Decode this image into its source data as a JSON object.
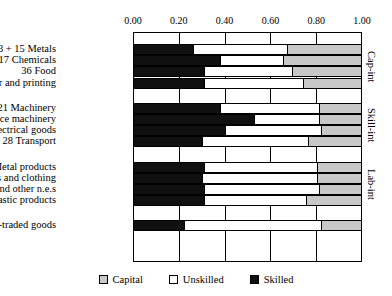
{
  "chart_data": {
    "type": "bar",
    "orientation": "horizontal",
    "stacked": true,
    "title": "",
    "xlabel": "",
    "ylabel": "",
    "xlim": [
      0.0,
      1.0
    ],
    "grid": true,
    "legend_position": "bottom",
    "tick_labels": [
      "0.00",
      "0.20",
      "0.40",
      "0.60",
      "0.80",
      "1.00"
    ],
    "tick_values": [
      0.0,
      0.2,
      0.4,
      0.6,
      0.8,
      1.0
    ],
    "series": [
      {
        "name": "Skilled",
        "color": "#101010",
        "values": [
          0.26,
          0.38,
          0.31,
          0.31,
          0.38,
          0.53,
          0.4,
          0.3,
          0.31,
          0.3,
          0.31,
          0.31,
          0.22
        ]
      },
      {
        "name": "Unskilled",
        "color": "#ffffff",
        "values": [
          0.42,
          0.28,
          0.39,
          0.44,
          0.44,
          0.29,
          0.43,
          0.47,
          0.5,
          0.51,
          0.51,
          0.45,
          0.61
        ]
      },
      {
        "name": "Capital",
        "color": "#c8c8c8",
        "values": [
          0.32,
          0.34,
          0.3,
          0.25,
          0.18,
          0.18,
          0.17,
          0.23,
          0.19,
          0.19,
          0.18,
          0.24,
          0.17
        ]
      }
    ],
    "categories": [
      "13 + 15 Metals",
      "17 Chemicals",
      "36 Food",
      "47 Paper and printing",
      "21 Machinery",
      "23 Office machinery",
      "25 Electrical goods",
      "28 Transport",
      "19 Metal products",
      "42 Textiles and clothing",
      "48 Timber and other n.e.s",
      "49 Plastic products",
      "Non-traded goods"
    ],
    "legend": [
      {
        "label": "Capital",
        "color": "#c8c8c8"
      },
      {
        "label": "Unskilled",
        "color": "#ffffff"
      },
      {
        "label": "Skilled",
        "color": "#101010"
      }
    ],
    "groups": [
      {
        "label": "Cap-int",
        "rows": [
          0,
          1,
          2,
          3
        ]
      },
      {
        "label": "Skill-int",
        "rows": [
          4,
          5,
          6,
          7
        ]
      },
      {
        "label": "Lab-int",
        "rows": [
          8,
          9,
          10,
          11
        ]
      },
      {
        "label": "",
        "rows": [
          12
        ]
      }
    ]
  },
  "axis": {
    "ticks": [
      {
        "label": "0.00",
        "value": 0.0
      },
      {
        "label": "0.20",
        "value": 0.2
      },
      {
        "label": "0.40",
        "value": 0.4
      },
      {
        "label": "0.60",
        "value": 0.6
      },
      {
        "label": "0.80",
        "value": 0.8
      },
      {
        "label": "1.00",
        "value": 1.0
      }
    ]
  },
  "rows": [
    {
      "label": "13 + 15 Metals",
      "skilled": 0.26,
      "unskilled": 0.42,
      "capital": 0.32
    },
    {
      "label": "17 Chemicals",
      "skilled": 0.38,
      "unskilled": 0.28,
      "capital": 0.34
    },
    {
      "label": "36 Food",
      "skilled": 0.31,
      "unskilled": 0.39,
      "capital": 0.3
    },
    {
      "label": "47 Paper and printing",
      "skilled": 0.31,
      "unskilled": 0.44,
      "capital": 0.25
    },
    {
      "label": "21 Machinery",
      "skilled": 0.38,
      "unskilled": 0.44,
      "capital": 0.18
    },
    {
      "label": "23 Office machinery",
      "skilled": 0.53,
      "unskilled": 0.29,
      "capital": 0.18
    },
    {
      "label": "25 Electrical goods",
      "skilled": 0.4,
      "unskilled": 0.43,
      "capital": 0.17
    },
    {
      "label": "28 Transport",
      "skilled": 0.3,
      "unskilled": 0.47,
      "capital": 0.23
    },
    {
      "label": "19 Metal products",
      "skilled": 0.31,
      "unskilled": 0.5,
      "capital": 0.19
    },
    {
      "label": "42 Textiles and clothing",
      "skilled": 0.3,
      "unskilled": 0.51,
      "capital": 0.19
    },
    {
      "label": "48 Timber and other n.e.s",
      "skilled": 0.31,
      "unskilled": 0.51,
      "capital": 0.18
    },
    {
      "label": "49 Plastic products",
      "skilled": 0.31,
      "unskilled": 0.45,
      "capital": 0.24
    },
    {
      "label": "Non-traded goods",
      "skilled": 0.22,
      "unskilled": 0.61,
      "capital": 0.17
    }
  ],
  "group_labels": [
    {
      "label": "Cap-int"
    },
    {
      "label": "Skill-int"
    },
    {
      "label": "Lab-int"
    }
  ],
  "legend": {
    "capital": "Capital",
    "unskilled": "Unskilled",
    "skilled": "Skilled"
  }
}
